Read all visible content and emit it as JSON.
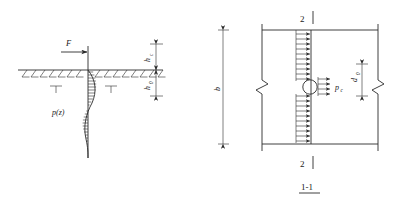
{
  "figure": {
    "title": "",
    "panels": [
      {
        "id": "left-panel",
        "name": "pile-soil-pressure-elevation",
        "labels": {
          "force": "F",
          "pressure_distribution": "p(z)",
          "height_above_ground": "h",
          "height_above_ground_sub": "c",
          "depth_below_ground": "h",
          "depth_below_ground_sub": "0"
        }
      },
      {
        "id": "right-panel",
        "name": "pile-section-plan",
        "labels": {
          "section_marker_top": "2",
          "section_marker_bottom": "2",
          "width": "b",
          "diameter": "d",
          "diameter_sub": "0",
          "pressure": "p",
          "pressure_sub": "c",
          "section_caption": "1-1"
        }
      }
    ],
    "colors": {
      "line": "#2b2b2b",
      "thin_line": "#3a3a3a",
      "text": "#1a1a1a",
      "background": "#ffffff"
    }
  }
}
